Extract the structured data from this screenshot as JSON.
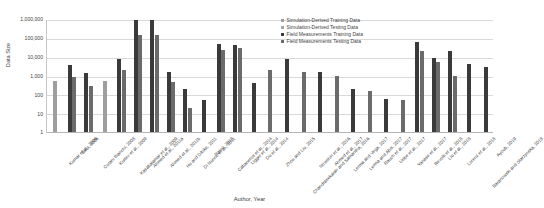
{
  "chart_data": {
    "type": "bar",
    "title": "",
    "xlabel": "Author, Year",
    "ylabel": "Data Size",
    "yscale": "log",
    "ylim": [
      1,
      1000000
    ],
    "yticks": [
      "1",
      "10",
      "100",
      "1,000",
      "10,000",
      "100,000",
      "1,000,000"
    ],
    "grid": true,
    "legend_position": "top-right",
    "series_names": [
      "Simulation-Derived Training Data",
      "Simulation-Derived Testing Data",
      "Field Measurements Training Data",
      "Field Measurements Testing Data"
    ],
    "series_colors": [
      "#9e9e9e",
      "#a8a8a8",
      "#3a3a3a",
      "#6b6b6b"
    ],
    "categories": [
      "Kumar et al., 2006",
      "Birol, 2006",
      "Corani Bianchi, 2008",
      "Kurtev et al., 2009",
      "Kasabalamar et al., 2009",
      "Ahmed et al., 2011a",
      "Ahmed et al., 2011b",
      "Hu and Dibike, 2011",
      "Di Nunno et al., 2011",
      "Nanni, 2013",
      "Cabaneros et al., 2014",
      "Ligger et al., 2014",
      "Du et al., 2014",
      "Zhou and Liu, 2015",
      "Chandrasekaran and Samantha, 2016",
      "Nowshin et al., 2016",
      "Ahmed et al., 2017",
      "Lerma and Vega, 2017",
      "Lerma and Abis, 2017",
      "Rauch et al., 2017",
      "Uribe et al., 2017",
      "Yanase et al., 2017",
      "Revolti et al., 2018",
      "Liu et al., 2018",
      "Lorenz et al., 2018",
      "Baranowski and Starzynska, 2018",
      "Ayoub, 2019"
    ],
    "series": [
      {
        "name": "Simulation-Derived Training Data",
        "values": [
          500,
          null,
          null,
          null,
          500,
          null,
          null,
          null,
          null,
          null,
          null,
          null,
          null,
          null,
          null,
          null,
          null,
          null,
          null,
          null,
          null,
          null,
          null,
          null,
          null,
          null,
          null
        ]
      },
      {
        "name": "Simulation-Derived Testing Data",
        "values": [
          null,
          null,
          null,
          null,
          null,
          null,
          null,
          null,
          null,
          null,
          null,
          null,
          null,
          null,
          null,
          null,
          null,
          null,
          null,
          null,
          null,
          null,
          null,
          null,
          null,
          null,
          null
        ]
      },
      {
        "name": "Field Measurements Training Data",
        "values": [
          null,
          3500,
          1300,
          null,
          null,
          8000,
          900000,
          900000,
          1500,
          200,
          null,
          50,
          50000,
          40000,
          60000,
          null,
          600,
          400,
          400,
          70000,
          40000,
          2500,
          2000,
          5000,
          2000,
          4000,
          2000
        ],
        "note": "dark bars"
      },
      {
        "name": "Field Measurements Testing Data",
        "values": [
          null,
          800,
          280,
          null,
          null,
          2000,
          150000,
          150000,
          450,
          20,
          null,
          null,
          22000,
          30000,
          35000,
          null,
          150,
          40,
          40,
          30000,
          20000,
          500,
          900,
          1200,
          300,
          600,
          null
        ],
        "note": "mid-grey bars"
      }
    ],
    "bars": [
      {
        "category": "Kumar et al., 2006",
        "values": [
          {
            "series": 0,
            "value": 500
          }
        ]
      },
      {
        "category": "Birol, 2006",
        "values": [
          {
            "series": 2,
            "value": 3500
          },
          {
            "series": 3,
            "value": 800
          }
        ]
      },
      {
        "category": "Corani Bianchi, 2008",
        "values": [
          {
            "series": 2,
            "value": 1300
          },
          {
            "series": 3,
            "value": 280
          }
        ]
      },
      {
        "category": "Kurtev et al., 2009",
        "values": [
          {
            "series": 0,
            "value": 500
          }
        ]
      },
      {
        "category": "Kasabalamar et al., 2009",
        "values": [
          {
            "series": 2,
            "value": 8000
          },
          {
            "series": 3,
            "value": 2000
          }
        ]
      },
      {
        "category": "Ahmed et al., 2011a",
        "values": [
          {
            "series": 2,
            "value": 900000
          },
          {
            "series": 3,
            "value": 150000
          }
        ]
      },
      {
        "category": "Ahmed et al., 2011b",
        "values": [
          {
            "series": 2,
            "value": 900000
          },
          {
            "series": 3,
            "value": 150000
          }
        ]
      },
      {
        "category": "Hu and Dibike, 2011",
        "values": [
          {
            "series": 2,
            "value": 1500
          },
          {
            "series": 3,
            "value": 450
          }
        ]
      },
      {
        "category": "Di Nunno et al., 2011",
        "values": [
          {
            "series": 2,
            "value": 200
          },
          {
            "series": 3,
            "value": 20
          }
        ]
      },
      {
        "category": "Nanni, 2013",
        "values": [
          {
            "series": 2,
            "value": 50
          }
        ]
      },
      {
        "category": "Cabaneros et al., 2014",
        "values": [
          {
            "series": 2,
            "value": 50000
          },
          {
            "series": 3,
            "value": 22000
          }
        ]
      },
      {
        "category": "Ligger et al., 2014",
        "values": [
          {
            "series": 2,
            "value": 40000
          },
          {
            "series": 3,
            "value": 30000
          }
        ]
      },
      {
        "category": "Du et al., 2014",
        "values": [
          {
            "series": 2,
            "value": 400
          }
        ]
      },
      {
        "category": "Zhou and Liu, 2015",
        "values": [
          {
            "series": 3,
            "value": 2000
          }
        ]
      },
      {
        "category": "Chandrasekaran and Samantha, 2016",
        "values": [
          {
            "series": 2,
            "value": 8000
          }
        ]
      },
      {
        "category": "Nowshin et al., 2016",
        "values": [
          {
            "series": 3,
            "value": 1500
          }
        ]
      },
      {
        "category": "Ahmed et al., 2017",
        "values": [
          {
            "series": 2,
            "value": 1500
          }
        ]
      },
      {
        "category": "Lerma and Vega, 2017",
        "values": [
          {
            "series": 3,
            "value": 1000
          }
        ]
      },
      {
        "category": "Lerma and Abis, 2017",
        "values": [
          {
            "series": 2,
            "value": 200
          }
        ]
      },
      {
        "category": "Rauch et al., 2017",
        "values": [
          {
            "series": 3,
            "value": 150
          }
        ]
      },
      {
        "category": "Uribe et al., 2017",
        "values": [
          {
            "series": 2,
            "value": 60
          }
        ]
      },
      {
        "category": "Yanase et al., 2017",
        "values": [
          {
            "series": 3,
            "value": 50
          }
        ]
      },
      {
        "category": "Revolti et al., 2018",
        "values": [
          {
            "series": 2,
            "value": 60000
          },
          {
            "series": 3,
            "value": 20000
          }
        ]
      },
      {
        "category": "Liu et al., 2018",
        "values": [
          {
            "series": 2,
            "value": 9000
          },
          {
            "series": 3,
            "value": 5000
          }
        ]
      },
      {
        "category": "Lorenz et al., 2018",
        "values": [
          {
            "series": 2,
            "value": 20000
          },
          {
            "series": 3,
            "value": 900
          }
        ]
      },
      {
        "category": "Baranowski and Starzynska, 2018",
        "values": [
          {
            "series": 2,
            "value": 4000
          }
        ]
      },
      {
        "category": "Ayoub, 2019",
        "values": [
          {
            "series": 2,
            "value": 3000
          }
        ]
      }
    ]
  }
}
